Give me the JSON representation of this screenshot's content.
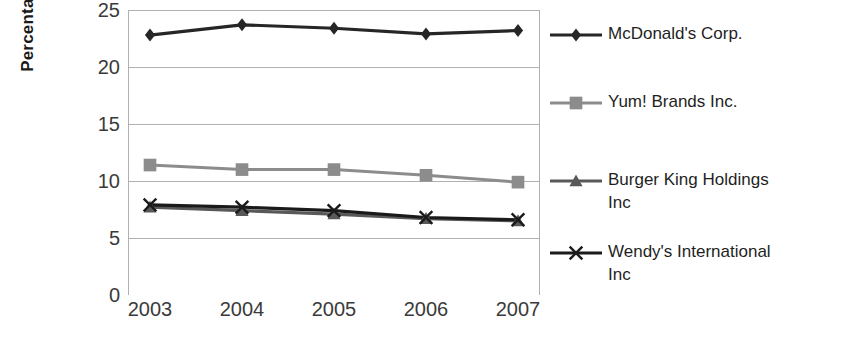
{
  "chart_data": {
    "type": "line",
    "title": "",
    "xlabel": "",
    "ylabel": "Percentage",
    "categories": [
      "2003",
      "2004",
      "2005",
      "2006",
      "2007"
    ],
    "ylim": [
      0,
      25
    ],
    "yticks": [
      0,
      5,
      10,
      15,
      20,
      25
    ],
    "grid": true,
    "legend_position": "right",
    "series": [
      {
        "name": "McDonald's Corp.",
        "marker": "diamond",
        "color": "#262626",
        "values": [
          22.8,
          23.7,
          23.4,
          22.9,
          23.2
        ]
      },
      {
        "name": "Yum! Brands Inc.",
        "marker": "square",
        "color": "#8c8c8c",
        "values": [
          11.4,
          11.0,
          11.0,
          10.5,
          9.9
        ]
      },
      {
        "name": "Burger King Holdings\nInc",
        "marker": "triangle",
        "color": "#595959",
        "values": [
          7.7,
          7.4,
          7.1,
          6.7,
          6.5
        ]
      },
      {
        "name": "Wendy's International\nInc",
        "marker": "x",
        "color": "#1a1a1a",
        "values": [
          7.9,
          7.7,
          7.4,
          6.8,
          6.6
        ]
      }
    ]
  },
  "axis": {
    "y_title": "Percentage",
    "y_tick_labels": [
      "25",
      "20",
      "15",
      "10",
      "5",
      "0"
    ],
    "x_tick_labels": [
      "2003",
      "2004",
      "2005",
      "2006",
      "2007"
    ]
  },
  "legend": {
    "items": [
      {
        "label": "McDonald's Corp."
      },
      {
        "label": "Yum! Brands Inc."
      },
      {
        "label": "Burger King Holdings\nInc"
      },
      {
        "label": "Wendy's International\nInc"
      }
    ]
  },
  "colors": {
    "mcdonalds": "#262626",
    "yum": "#8c8c8c",
    "burger_king": "#595959",
    "wendys": "#1a1a1a",
    "gridline": "#b0b0b0",
    "background": "#ffffff"
  }
}
